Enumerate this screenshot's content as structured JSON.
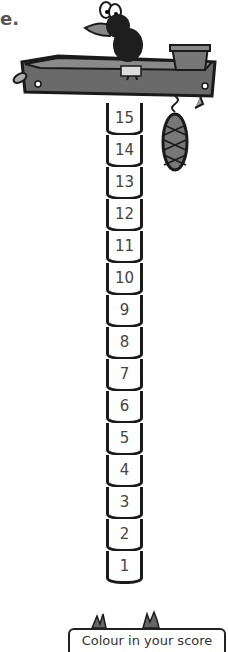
{
  "fragment_text": "e.",
  "tower": {
    "segments": [
      "15",
      "14",
      "13",
      "12",
      "11",
      "10",
      "9",
      "8",
      "7",
      "6",
      "5",
      "4",
      "3",
      "2",
      "1"
    ]
  },
  "caption": "Colour in your score",
  "colors": {
    "tray": "#6a6a6a",
    "outline": "#1a1a1a",
    "bird": "#1e1e1e"
  }
}
